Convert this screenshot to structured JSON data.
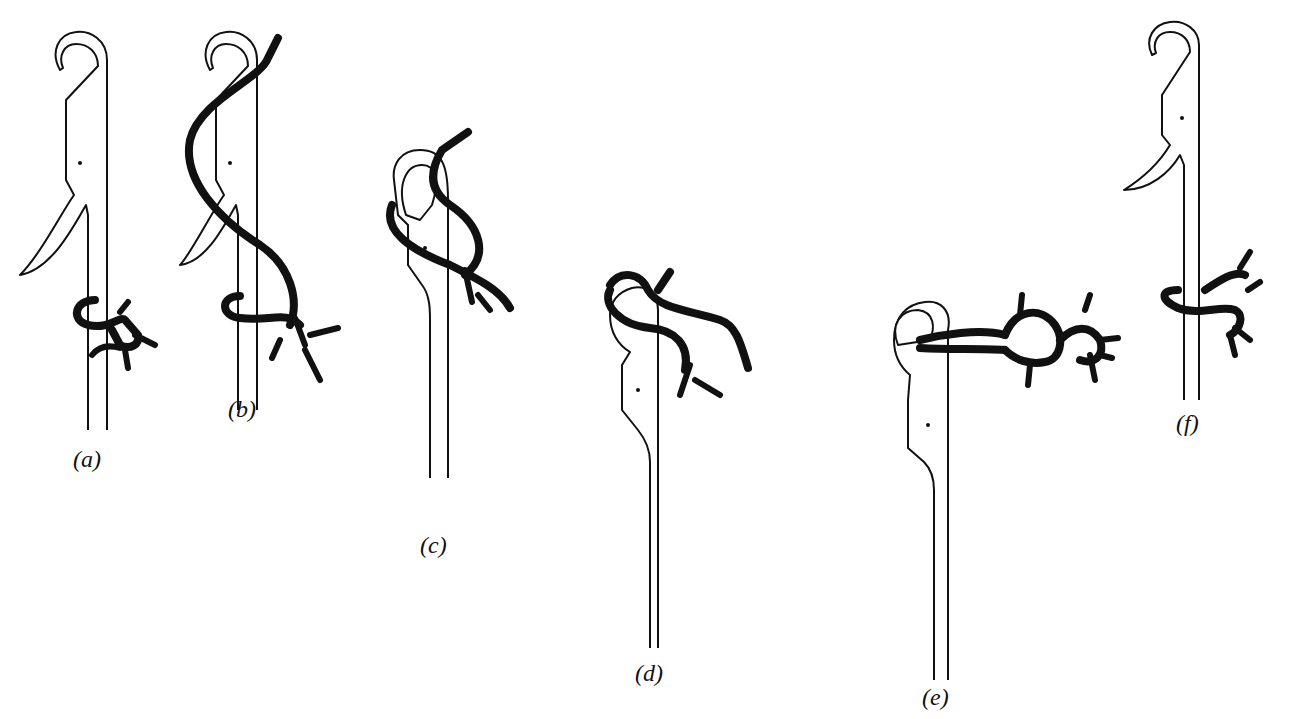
{
  "figure": {
    "background_color": "#ffffff",
    "ink_color": "#111111",
    "panels": [
      {
        "id": "a",
        "label": "(a)"
      },
      {
        "id": "b",
        "label": "(b)"
      },
      {
        "id": "c",
        "label": "(c)"
      },
      {
        "id": "d",
        "label": "(d)"
      },
      {
        "id": "e",
        "label": "(e)"
      },
      {
        "id": "f",
        "label": "(f)"
      }
    ]
  }
}
